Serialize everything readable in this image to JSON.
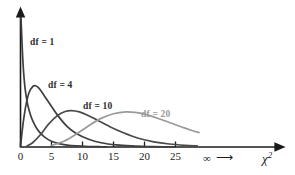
{
  "chart_data": {
    "type": "line",
    "title": "",
    "subtitle": "",
    "xlabel": "χ²",
    "ylabel": "",
    "xlim": [
      0,
      29
    ],
    "ylim": [
      0,
      1
    ],
    "grid": false,
    "legend_position": "inline-annotations",
    "x_ticks": [
      {
        "value": 0,
        "label": "0"
      },
      {
        "value": 5,
        "label": "5"
      },
      {
        "value": 10,
        "label": "10"
      },
      {
        "value": 15,
        "label": "15"
      },
      {
        "value": 20,
        "label": "20"
      },
      {
        "value": 25,
        "label": "25"
      }
    ],
    "y_ticks": [],
    "annotations": [
      {
        "name": "infinity-marker",
        "text": "∞",
        "x": 22.5,
        "note": "followed by right arrow"
      },
      {
        "name": "infinity-arrow",
        "text": "⟶",
        "x": 24.5
      }
    ],
    "series": [
      {
        "name": "df = 1",
        "label": "df = 1",
        "df": 1,
        "color": "#3f3f3f",
        "peak_x": 0,
        "x": [
          0.08,
          0.2,
          0.35,
          0.5,
          0.7,
          0.9,
          1.2,
          1.6,
          2.0,
          2.6,
          3.2,
          4.0,
          5.0,
          6.2,
          7.5,
          9.0,
          11.0,
          13.0,
          13.8
        ],
        "y": [
          1.0,
          0.86,
          0.7,
          0.58,
          0.47,
          0.4,
          0.32,
          0.25,
          0.2,
          0.145,
          0.108,
          0.073,
          0.045,
          0.026,
          0.015,
          0.0085,
          0.004,
          0.002,
          0.0014
        ]
      },
      {
        "name": "df = 4",
        "label": "df = 4",
        "df": 4,
        "color": "#3f3f3f",
        "peak_x": 2.2,
        "x": [
          0.0,
          0.4,
          0.9,
          1.4,
          2.0,
          2.4,
          3.0,
          3.8,
          4.8,
          6.0,
          7.5,
          9.0,
          11.0,
          13.0,
          15.5,
          18.0,
          20.5,
          23.0,
          24.8
        ],
        "y": [
          0.0,
          0.175,
          0.33,
          0.425,
          0.47,
          0.475,
          0.455,
          0.4,
          0.33,
          0.245,
          0.16,
          0.105,
          0.06,
          0.033,
          0.016,
          0.008,
          0.004,
          0.002,
          0.0013
        ]
      },
      {
        "name": "df = 10",
        "label": "df = 10",
        "df": 10,
        "color": "#4a4a4a",
        "peak_x": 8.0,
        "x": [
          1.0,
          2.0,
          3.2,
          4.5,
          6.0,
          7.2,
          8.2,
          9.5,
          11.0,
          12.5,
          14.5,
          16.5,
          19.0,
          21.5,
          24.0,
          26.5,
          28.5
        ],
        "y": [
          0.006,
          0.035,
          0.095,
          0.175,
          0.245,
          0.275,
          0.282,
          0.272,
          0.243,
          0.205,
          0.155,
          0.112,
          0.068,
          0.04,
          0.023,
          0.013,
          0.008
        ]
      },
      {
        "name": "df = 20",
        "label": "df = 20",
        "df": 20,
        "color": "#9a9a9a",
        "peak_x": 17.5,
        "x": [
          5.0,
          7.0,
          9.0,
          11.0,
          13.0,
          15.0,
          17.0,
          18.5,
          20.0,
          22.0,
          24.0,
          26.0,
          27.5,
          28.8
        ],
        "y": [
          0.012,
          0.045,
          0.1,
          0.165,
          0.222,
          0.258,
          0.272,
          0.268,
          0.255,
          0.225,
          0.19,
          0.155,
          0.13,
          0.112
        ]
      }
    ]
  },
  "axis": {
    "x_axis_label": "χ",
    "x_axis_label_sup": "2",
    "infinity_symbol": "∞",
    "infinity_arrow": "⟶"
  },
  "colors": {
    "axis": "#1b1b1b",
    "dark_curve": "#3f3f3f",
    "mid_curve": "#4a4a4a",
    "light_curve": "#9a9a9a",
    "background": "#ffffff",
    "text": "#1b1b1b"
  },
  "labels": {
    "df1": "df = 1",
    "df4": "df = 4",
    "df10": "df = 10",
    "df20": "df = 20"
  },
  "ticks": {
    "t0": "0",
    "t5": "5",
    "t10": "10",
    "t15": "15",
    "t20": "20",
    "t25": "25"
  }
}
